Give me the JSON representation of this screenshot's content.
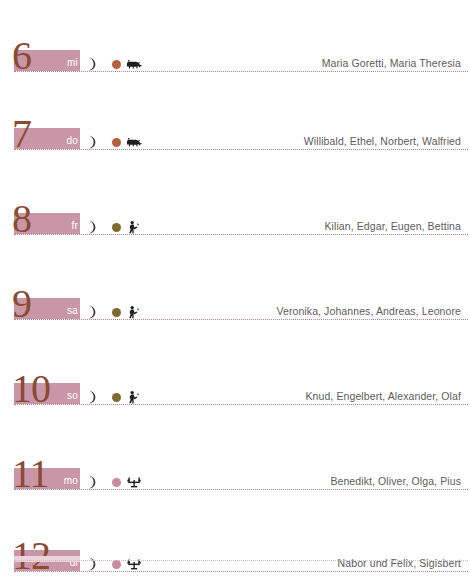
{
  "page": {
    "accent_bar_color": "#c996a8",
    "number_color": "#8a4b33",
    "rule_color": "#b9808f",
    "name_text_color": "#5c5c5c"
  },
  "days": [
    {
      "number": "6",
      "weekday": "mi",
      "moon": "waxing-crescent",
      "sign_dot_color": "#b5613c",
      "sign_icon": "taurus-ox-icon",
      "names": "Maria Goretti, Maria Theresia"
    },
    {
      "number": "7",
      "weekday": "do",
      "moon": "waxing-crescent",
      "sign_dot_color": "#b5613c",
      "sign_icon": "taurus-ox-icon",
      "names": "Willibald, Ethel, Norbert, Walfried"
    },
    {
      "number": "8",
      "weekday": "fr",
      "moon": "waxing-crescent",
      "sign_dot_color": "#7d6a2e",
      "sign_icon": "gemini-figure-icon",
      "names": "Kilian, Edgar, Eugen, Bettina"
    },
    {
      "number": "9",
      "weekday": "sa",
      "moon": "waxing-crescent",
      "sign_dot_color": "#7d6a2e",
      "sign_icon": "gemini-figure-icon",
      "names": "Veronika, Johannes, Andreas, Leonore"
    },
    {
      "number": "10",
      "weekday": "so",
      "moon": "waxing-crescent",
      "sign_dot_color": "#7d6a2e",
      "sign_icon": "gemini-figure-icon",
      "names": "Knud, Engelbert, Alexander, Olaf"
    },
    {
      "number": "11",
      "weekday": "mo",
      "moon": "waxing-crescent",
      "sign_dot_color": "#c98ba0",
      "sign_icon": "cancer-crab-icon",
      "names": "Benedikt, Oliver, Olga, Pius"
    },
    {
      "number": "12",
      "weekday": "di",
      "moon": "waxing-crescent",
      "sign_dot_color": "#c98ba0",
      "sign_icon": "cancer-crab-icon",
      "names": "Nabor und Felix, Sigisbert"
    }
  ]
}
